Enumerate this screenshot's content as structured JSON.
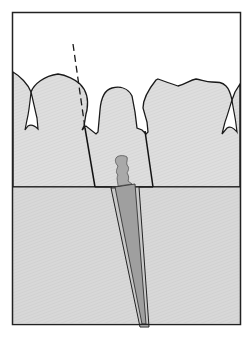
{
  "diagram": {
    "title": "",
    "colors": {
      "background": "#ffffff",
      "frame": "#222222",
      "tooth": "#dedede",
      "bone": "#d6d6d6",
      "outline": "#1a1a1a",
      "post": "#a9a9a9",
      "post_core": "#9a9a9a",
      "canal_sleeve": "#c4c4c4"
    },
    "elements": [
      {
        "name": "frame",
        "label": "Outer frame"
      },
      {
        "name": "bone-region",
        "label": "Bone / gingiva region"
      },
      {
        "name": "teeth-crowns",
        "label": "Tooth crowns"
      },
      {
        "name": "root-walls",
        "label": "Root walls"
      },
      {
        "name": "post-core",
        "label": "Post core"
      },
      {
        "name": "tapered-post",
        "label": "Tapered post in canal"
      },
      {
        "name": "axis-dashed-line",
        "label": "Dashed axis line"
      }
    ]
  }
}
